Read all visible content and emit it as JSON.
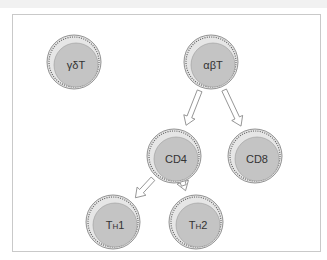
{
  "diagram": {
    "colors": {
      "cell_fill": "#c4c4c4",
      "cell_outer": "#e6e6e6",
      "cell_stroke": "#7a7a7a",
      "arrow_stroke": "#8a8a8a",
      "frame": "#c9c9c9"
    },
    "nodes": [
      {
        "id": "gdT",
        "label": "γδT"
      },
      {
        "id": "abT",
        "label": "αβT"
      },
      {
        "id": "CD4",
        "label": "CD4"
      },
      {
        "id": "CD8",
        "label": "CD8"
      },
      {
        "id": "TH1",
        "label": "TH1",
        "main": "T",
        "sub": "H",
        "num": "1"
      },
      {
        "id": "TH2",
        "label": "TH2",
        "main": "T",
        "sub": "H",
        "num": "2"
      }
    ],
    "edges": [
      {
        "from": "abT",
        "to": "CD4"
      },
      {
        "from": "abT",
        "to": "CD8"
      },
      {
        "from": "CD4",
        "to": "TH1"
      },
      {
        "from": "CD4",
        "to": "TH2"
      }
    ]
  }
}
